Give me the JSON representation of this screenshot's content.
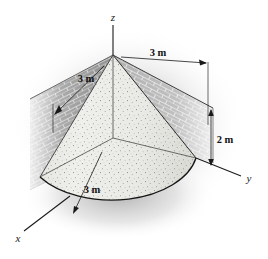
{
  "figure": {
    "background_color": "#ffffff",
    "ink_color": "#1a1a1a"
  },
  "axes": {
    "z": {
      "label": "z"
    },
    "x": {
      "label": "x"
    },
    "y": {
      "label": "y"
    }
  },
  "dimensions": {
    "top_wall_width": "3 m",
    "left_wall_width": "3 m",
    "wall_height": "2 m",
    "cone_radius": "3 m"
  },
  "objects": {
    "wall_left_name": "brick-wall-left",
    "wall_right_name": "brick-wall-right",
    "cone_name": "quarter-cone-solid"
  },
  "colors": {
    "brick_light": "#d9d9d9",
    "brick_dark": "#9a9a9a",
    "brick_mortar": "#f2f2f2",
    "cone_fill": "#ececea",
    "cone_shade": "#d6d6d2",
    "outline": "#1a1a1a",
    "shadow": "#b6b6b6"
  }
}
